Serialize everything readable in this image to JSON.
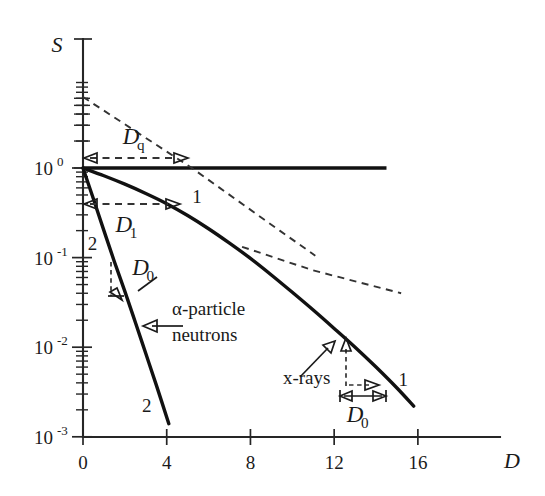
{
  "chart_data": {
    "type": "line",
    "title": "",
    "xlabel": "D",
    "ylabel": "S",
    "xlim": [
      -0.4,
      19.2
    ],
    "ylim_log": [
      -3.2,
      0.82
    ],
    "grid": false,
    "legend": "none",
    "x_ticks": [
      0,
      4,
      8,
      12,
      16
    ],
    "x_tick_labels": [
      "0",
      "4",
      "8",
      "12",
      "16"
    ],
    "y_ticks_exp": [
      0,
      -1,
      -2,
      -3
    ],
    "y_tick_labels": [
      "10",
      "10",
      "10",
      "10"
    ],
    "y_tick_exponents": [
      "0",
      "-1",
      "-2",
      "-3"
    ],
    "series": [
      {
        "name": "curve-2-alpha-particle-neutrons",
        "style": "solid",
        "label": "2",
        "description": "alpha-particle / neutrons exponential survival, single-hit",
        "points": [
          {
            "x": 0.0,
            "y": 1.0
          },
          {
            "x": 0.5,
            "y": 0.45
          },
          {
            "x": 1.0,
            "y": 0.2
          },
          {
            "x": 1.5,
            "y": 0.09
          },
          {
            "x": 2.0,
            "y": 0.042
          },
          {
            "x": 2.5,
            "y": 0.019
          },
          {
            "x": 3.0,
            "y": 0.0085
          },
          {
            "x": 3.5,
            "y": 0.0038
          },
          {
            "x": 4.1,
            "y": 0.0014
          }
        ]
      },
      {
        "name": "curve-1-x-rays",
        "style": "solid",
        "label": "1",
        "description": "x-rays multi-target shouldered survival curve",
        "points": [
          {
            "x": 0.0,
            "y": 1.0
          },
          {
            "x": 1.0,
            "y": 0.82
          },
          {
            "x": 2.0,
            "y": 0.66
          },
          {
            "x": 3.0,
            "y": 0.52
          },
          {
            "x": 4.0,
            "y": 0.4
          },
          {
            "x": 5.0,
            "y": 0.295
          },
          {
            "x": 6.0,
            "y": 0.21
          },
          {
            "x": 7.0,
            "y": 0.145
          },
          {
            "x": 8.0,
            "y": 0.098
          },
          {
            "x": 9.0,
            "y": 0.064
          },
          {
            "x": 10.0,
            "y": 0.041
          },
          {
            "x": 11.0,
            "y": 0.026
          },
          {
            "x": 12.0,
            "y": 0.0162
          },
          {
            "x": 13.0,
            "y": 0.01
          },
          {
            "x": 14.0,
            "y": 0.006
          },
          {
            "x": 15.0,
            "y": 0.0035
          },
          {
            "x": 15.8,
            "y": 0.0022
          }
        ]
      },
      {
        "name": "saturation-line",
        "style": "solid",
        "description": "horizontal reference line at S = 1",
        "points": [
          {
            "x": 0.0,
            "y": 1.0
          },
          {
            "x": 14.5,
            "y": 1.0
          }
        ]
      },
      {
        "name": "extrapolation-dashed-quasi-threshold",
        "style": "dashed",
        "description": "back-extrapolated terminal slope of curve 1 defining Dq",
        "points": [
          {
            "x": 0.0,
            "y": 6.2
          },
          {
            "x": 5.2,
            "y": 1.0
          },
          {
            "x": 9.4,
            "y": 0.2
          },
          {
            "x": 11.1,
            "y": 0.105
          }
        ]
      },
      {
        "name": "tangent-dashed-d1",
        "style": "dashed",
        "description": "shallow dashed tangent branch through the shoulder region",
        "points": [
          {
            "x": 7.6,
            "y": 0.132
          },
          {
            "x": 11.0,
            "y": 0.072
          },
          {
            "x": 15.2,
            "y": 0.04
          }
        ]
      }
    ],
    "annotations": [
      {
        "name": "dq-arrow",
        "label": "Dq",
        "label_base": "D",
        "label_sub": "q",
        "type": "double-arrow-horizontal",
        "x_from": 0.0,
        "x_to": 5.2,
        "y": 1.52
      },
      {
        "name": "d1-arrow",
        "label": "D1",
        "label_base": "D",
        "label_sub": "1",
        "type": "double-arrow-horizontal",
        "x_from": 0.0,
        "x_to": 4.5,
        "y": 0.4
      },
      {
        "name": "d0-left",
        "label": "D0",
        "label_base": "D",
        "label_sub": "0",
        "type": "bracket-arrow",
        "x": 1.6,
        "y_from": 0.085,
        "y_to": 0.036
      },
      {
        "name": "d0-right",
        "label": "D0",
        "label_base": "D",
        "label_sub": "0",
        "type": "double-arrow-horizontal",
        "x_from": 12.6,
        "x_to": 14.4,
        "y": 0.0043
      },
      {
        "name": "alpha-particle-neutrons-label",
        "label": "α-particle",
        "label_line2": "neutrons",
        "type": "arrow-text",
        "x": 3.3,
        "y": 0.0135
      },
      {
        "name": "x-rays-label",
        "label": "x-rays",
        "type": "arrow-text",
        "x": 11.9,
        "y": 0.0072
      },
      {
        "name": "curve-label-2-upper",
        "label": "2",
        "x": 0.45,
        "y": 0.135
      },
      {
        "name": "curve-label-2-lower",
        "label": "2",
        "x": 3.1,
        "y": 0.0028
      },
      {
        "name": "curve-label-1-upper",
        "label": "1",
        "x": 5.4,
        "y": 0.36
      },
      {
        "name": "curve-label-1-lower",
        "label": "1",
        "x": 15.1,
        "y": 0.0072
      }
    ]
  },
  "colors": {
    "ink": "#1a1a1a",
    "curve": "#111111",
    "dashed": "#333333",
    "background": "#ffffff"
  }
}
